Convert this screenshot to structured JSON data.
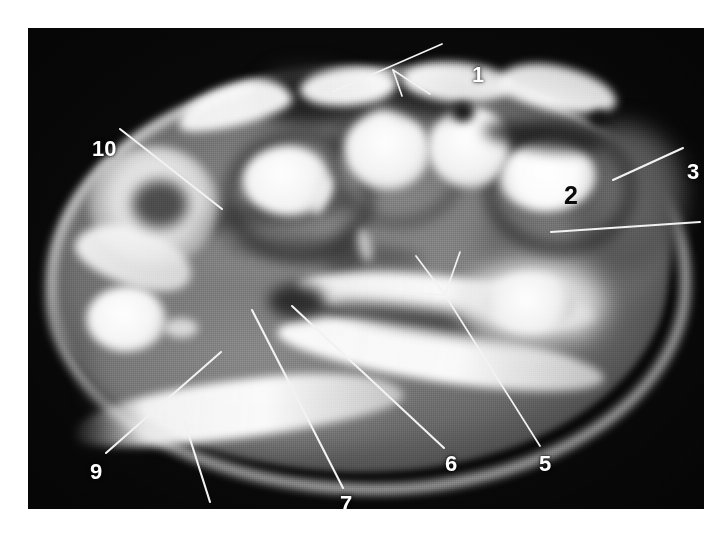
{
  "figure": {
    "kind": "axial-mri-cross-section",
    "modality_appearance": "grayscale magnetic-resonance axial section of a limb (wrist/forearm level)",
    "background_color": "#ffffff",
    "plate_color": "#090909",
    "label_color": "#ffffff",
    "dark_label_color": "#0b0b0b",
    "leader_color": "#f2f2f2"
  },
  "plate": {
    "x": 28,
    "y": 28,
    "width": 676,
    "height": 481
  },
  "labels": [
    {
      "id": "1",
      "text": "1",
      "x": 444,
      "y": 36,
      "style": "light"
    },
    {
      "id": "2",
      "text": "2",
      "x": 536,
      "y": 155,
      "style": "dark"
    },
    {
      "id": "3",
      "text": "3",
      "x": 659,
      "y": 133,
      "style": "light"
    },
    {
      "id": "4",
      "text": "4",
      "x": 678,
      "y": 210,
      "style": "light"
    },
    {
      "id": "5",
      "text": "5",
      "x": 511,
      "y": 425,
      "style": "light"
    },
    {
      "id": "6",
      "text": "6",
      "x": 417,
      "y": 425,
      "style": "light"
    },
    {
      "id": "7",
      "text": "7",
      "x": 312,
      "y": 465,
      "style": "light"
    },
    {
      "id": "8",
      "text": "8",
      "x": 177,
      "y": 480,
      "style": "light"
    },
    {
      "id": "9",
      "text": "9",
      "x": 62,
      "y": 433,
      "style": "light"
    },
    {
      "id": "10",
      "text": "10",
      "x": 64,
      "y": 110,
      "style": "light"
    }
  ],
  "leader_lines": [
    {
      "for": "1",
      "x1": 414,
      "y1": 16,
      "x2": 304,
      "y2": 64
    },
    {
      "for": "1",
      "x1": 365,
      "y1": 42,
      "x2": 374,
      "y2": 68
    },
    {
      "for": "1",
      "x1": 365,
      "y1": 42,
      "x2": 402,
      "y2": 66
    },
    {
      "for": "3",
      "x1": 655,
      "y1": 120,
      "x2": 585,
      "y2": 152
    },
    {
      "for": "4",
      "x1": 672,
      "y1": 194,
      "x2": 523,
      "y2": 204
    },
    {
      "for": "5",
      "x1": 512,
      "y1": 418,
      "x2": 417,
      "y2": 267
    },
    {
      "for": "5",
      "x1": 417,
      "y1": 267,
      "x2": 388,
      "y2": 228
    },
    {
      "for": "5",
      "x1": 417,
      "y1": 267,
      "x2": 432,
      "y2": 224
    },
    {
      "for": "5",
      "x1": 417,
      "y1": 267,
      "x2": 358,
      "y2": 264
    },
    {
      "for": "6",
      "x1": 416,
      "y1": 420,
      "x2": 264,
      "y2": 278
    },
    {
      "for": "7",
      "x1": 315,
      "y1": 460,
      "x2": 224,
      "y2": 282
    },
    {
      "for": "8",
      "x1": 182,
      "y1": 474,
      "x2": 156,
      "y2": 392
    },
    {
      "for": "9",
      "x1": 78,
      "y1": 425,
      "x2": 193,
      "y2": 324
    },
    {
      "for": "10",
      "x1": 92,
      "y1": 101,
      "x2": 194,
      "y2": 181
    }
  ]
}
